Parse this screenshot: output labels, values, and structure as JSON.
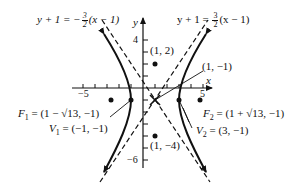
{
  "diagram": {
    "type": "hyperbola-graph",
    "axes": {
      "x_label": "x",
      "y_label": "y",
      "x_ticks": {
        "neg": "−5",
        "pos": "5"
      },
      "y_ticks": {
        "pos": "4",
        "neg": "−6"
      }
    },
    "asymptotes": [
      {
        "id": "neg",
        "lhs": "y + 1 = −",
        "num": "3",
        "den": "2",
        "rhs": "(x − 1)"
      },
      {
        "id": "pos",
        "lhs": "y + 1 = ",
        "num": "3",
        "den": "2",
        "rhs": "(x − 1)"
      }
    ],
    "points": {
      "center": "(1, −1)",
      "top_conj": "(1, 2)",
      "bottom_conj": "(1, −4)",
      "f1": {
        "name": "F",
        "sub": "1",
        "value": " = (1 − √13, −1)"
      },
      "f2": {
        "name": "F",
        "sub": "2",
        "value": " = (1 + √13, −1)"
      },
      "v1": {
        "name": "V",
        "sub": "1",
        "value": " = (−1, −1)"
      },
      "v2": {
        "name": "V",
        "sub": "2",
        "value": " = (3, −1)"
      }
    },
    "colors": {
      "ink": "#111111",
      "background": "#ffffff"
    }
  }
}
